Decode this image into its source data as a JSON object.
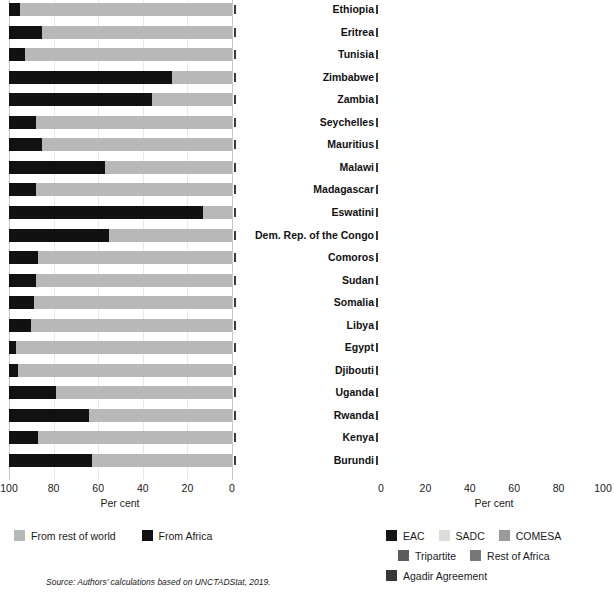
{
  "figure": {
    "source_note": "Source: Authors' calculations based on UNCTADStat, 2019."
  },
  "countries": [
    "Ethiopia",
    "Eritrea",
    "Tunisia",
    "Zimbabwe",
    "Zambia",
    "Seychelles",
    "Mauritius",
    "Malawi",
    "Madagascar",
    "Eswatini",
    "Dem. Rep. of the Congo",
    "Comoros",
    "Sudan",
    "Somalia",
    "Libya",
    "Egypt",
    "Djibouti",
    "Uganda",
    "Rwanda",
    "Kenya",
    "Burundi"
  ],
  "left_panel": {
    "axis_title": "Per cent",
    "ticks": [
      "100",
      "80",
      "60",
      "40",
      "20",
      "0"
    ],
    "legend": [
      {
        "label": "From rest of world",
        "color": "#b8b8b8"
      },
      {
        "label": "From Africa",
        "color": "#111111"
      }
    ]
  },
  "right_panel": {
    "axis_title": "Per cent",
    "ticks": [
      "0",
      "20",
      "40",
      "60",
      "80",
      "100"
    ],
    "legend": [
      {
        "label": "EAC",
        "color": "#151515"
      },
      {
        "label": "SADC",
        "color": "#dcdcdc"
      },
      {
        "label": "COMESA",
        "color": "#9a9a9a"
      },
      {
        "label": "Tripartite",
        "color": "#5c5c5c"
      },
      {
        "label": "Rest of Africa",
        "color": "#787878"
      },
      {
        "label": "Agadir Agreement",
        "color": "#383838"
      }
    ]
  },
  "chart_data": [
    {
      "type": "bar",
      "id": "imports-origin",
      "orientation": "horizontal-stacked",
      "title": "",
      "xlabel": "Per cent",
      "ylabel": "",
      "xlim": [
        100,
        0
      ],
      "x_reversed": true,
      "grid": true,
      "legend_position": "bottom-left",
      "categories": [
        "Ethiopia",
        "Eritrea",
        "Tunisia",
        "Zimbabwe",
        "Zambia",
        "Seychelles",
        "Mauritius",
        "Malawi",
        "Madagascar",
        "Eswatini",
        "Dem. Rep. of the Congo",
        "Comoros",
        "Sudan",
        "Somalia",
        "Libya",
        "Egypt",
        "Djibouti",
        "Uganda",
        "Rwanda",
        "Kenya",
        "Burundi"
      ],
      "series": [
        {
          "name": "From rest of world",
          "color": "#b8b8b8",
          "values": [
            95,
            85,
            93,
            27,
            36,
            88,
            85,
            57,
            88,
            13,
            55,
            87,
            88,
            89,
            90,
            97,
            96,
            79,
            64,
            87,
            63
          ]
        },
        {
          "name": "From Africa",
          "color": "#111111",
          "values": [
            5,
            15,
            7,
            73,
            64,
            12,
            15,
            43,
            12,
            87,
            45,
            13,
            12,
            11,
            10,
            3,
            4,
            21,
            36,
            13,
            37
          ]
        }
      ]
    },
    {
      "type": "bar",
      "id": "intra-african-imports-by-bloc",
      "orientation": "horizontal-stacked",
      "title": "",
      "xlabel": "Per cent",
      "ylabel": "",
      "xlim": [
        0,
        100
      ],
      "grid": true,
      "legend_position": "bottom-right",
      "categories": [
        "Ethiopia",
        "Eritrea",
        "Tunisia",
        "Zimbabwe",
        "Zambia",
        "Seychelles",
        "Mauritius",
        "Malawi",
        "Madagascar",
        "Eswatini",
        "Dem. Rep. of the Congo",
        "Comoros",
        "Sudan",
        "Somalia",
        "Libya",
        "Egypt",
        "Djibouti",
        "Uganda",
        "Rwanda",
        "Kenya",
        "Burundi"
      ],
      "series": [
        {
          "name": "EAC",
          "color": "#151515",
          "values": [
            0,
            0,
            0,
            0,
            0,
            0,
            0,
            0,
            0,
            0,
            0,
            0,
            0,
            0,
            0,
            0,
            0,
            59,
            57,
            31,
            72
          ]
        },
        {
          "name": "SADC",
          "color": "#dcdcdc",
          "values": [
            0,
            0,
            0,
            97,
            64,
            88,
            87,
            92,
            75,
            99,
            0,
            83,
            0,
            0,
            0,
            0,
            0,
            0,
            0,
            0,
            0
          ]
        },
        {
          "name": "COMESA",
          "color": "#9a9a9a",
          "values": [
            0,
            65,
            53,
            2,
            36,
            10,
            11,
            7,
            23,
            1,
            43,
            14,
            72,
            95,
            85,
            48,
            21,
            8,
            5,
            18,
            9
          ]
        },
        {
          "name": "Tripartite",
          "color": "#5c5c5c",
          "values": [
            97,
            33,
            38,
            0,
            0,
            0,
            0,
            0,
            0,
            0,
            56,
            0,
            0,
            0,
            0,
            0,
            0,
            0,
            0,
            0,
            0
          ]
        },
        {
          "name": "Rest of Africa",
          "color": "#787878",
          "values": [
            3,
            2,
            0,
            1,
            0,
            2,
            2,
            1,
            2,
            0,
            1,
            3,
            28,
            5,
            13,
            40,
            79,
            33,
            38,
            51,
            19
          ]
        },
        {
          "name": "Agadir Agreement",
          "color": "#383838",
          "values": [
            0,
            0,
            9,
            0,
            0,
            0,
            0,
            0,
            0,
            0,
            0,
            0,
            0,
            0,
            2,
            12,
            0,
            0,
            0,
            0,
            0
          ]
        }
      ]
    }
  ]
}
